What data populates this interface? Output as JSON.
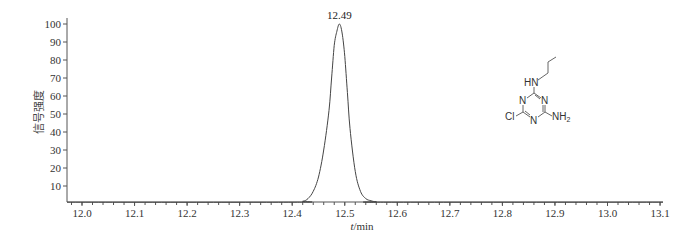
{
  "chart_data": {
    "type": "line",
    "title": "",
    "xlabel_italic": "t",
    "xlabel_unit": "/min",
    "xlabel": "t/min",
    "ylabel": "信号强度",
    "xlim": [
      11.97,
      13.12
    ],
    "ylim": [
      1,
      100
    ],
    "x_ticks": [
      "12.0",
      "12.1",
      "12.2",
      "12.3",
      "12.4",
      "12.5",
      "12.6",
      "12.7",
      "12.8",
      "12.9",
      "13.0",
      "13.1"
    ],
    "x_minor_tick_step": 0.02,
    "y_ticks": [
      "10",
      "20",
      "30",
      "40",
      "50",
      "60",
      "70",
      "80",
      "90",
      "100"
    ],
    "grid": false,
    "legend": null,
    "series": [
      {
        "name": "chromatogram",
        "x": [
          11.97,
          12.4,
          12.42,
          12.43,
          12.44,
          12.45,
          12.46,
          12.47,
          12.475,
          12.48,
          12.485,
          12.49,
          12.495,
          12.5,
          12.505,
          12.51,
          12.52,
          12.53,
          12.54,
          12.55,
          12.56,
          12.58,
          13.12
        ],
        "y": [
          1,
          1,
          1.5,
          3,
          7,
          15,
          30,
          52,
          70,
          88,
          96,
          100,
          95,
          82,
          62,
          42,
          18,
          7,
          3,
          1.8,
          1.2,
          1,
          1
        ]
      }
    ],
    "annotations": [
      {
        "text": "12.49",
        "x": 12.49,
        "y": 100,
        "type": "peak-retention-time"
      }
    ],
    "inset": {
      "type": "chemical-structure",
      "labels": [
        "HN",
        "N",
        "N",
        "N",
        "Cl",
        "NH2"
      ],
      "description": "2-chloro-4-ethylamino-6-amino-1,3,5-triazine (desisopropylatrazine)"
    }
  }
}
